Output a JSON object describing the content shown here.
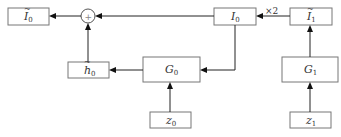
{
  "diagram": {
    "nodes": {
      "I0_tilde": {
        "base": "I",
        "sub": "0",
        "tilde": true
      },
      "sum": {
        "symbol": "+"
      },
      "I0": {
        "base": "I",
        "sub": "0",
        "tilde": false
      },
      "I1_tilde": {
        "base": "I",
        "sub": "1",
        "tilde": true
      },
      "h0_tilde": {
        "base": "h",
        "sub": "0",
        "tilde": true
      },
      "G0": {
        "base": "G",
        "sub": "0"
      },
      "G1": {
        "base": "G",
        "sub": "1"
      },
      "z0": {
        "base": "z",
        "sub": "0"
      },
      "z1": {
        "base": "z",
        "sub": "1"
      }
    },
    "edge_labels": {
      "scale": "×2"
    },
    "edges": [
      {
        "from": "z1",
        "to": "G1"
      },
      {
        "from": "G1",
        "to": "I1_tilde"
      },
      {
        "from": "I1_tilde",
        "to": "I0",
        "label": "×2"
      },
      {
        "from": "I0",
        "to": "sum"
      },
      {
        "from": "I0",
        "to": "G0"
      },
      {
        "from": "z0",
        "to": "G0"
      },
      {
        "from": "G0",
        "to": "h0_tilde"
      },
      {
        "from": "h0_tilde",
        "to": "sum"
      },
      {
        "from": "sum",
        "to": "I0_tilde"
      }
    ]
  }
}
